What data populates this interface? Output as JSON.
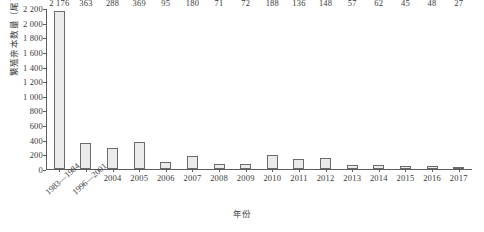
{
  "chart_data": {
    "type": "bar",
    "title": "",
    "xlabel": "年份",
    "ylabel": "繁殖亲本数量（尾）",
    "categories": [
      "1983—1984",
      "1996—2001",
      "2004",
      "2005",
      "2006",
      "2007",
      "2008",
      "2009",
      "2010",
      "2011",
      "2012",
      "2013",
      "2014",
      "2015",
      "2016",
      "2017"
    ],
    "values": [
      2176,
      363,
      288,
      369,
      95,
      180,
      71,
      72,
      188,
      136,
      148,
      57,
      62,
      45,
      48,
      27
    ],
    "value_labels": [
      "2 176",
      "363",
      "288",
      "369",
      "95",
      "180",
      "71",
      "72",
      "188",
      "136",
      "148",
      "57",
      "62",
      "45",
      "48",
      "27"
    ],
    "rotated_categories": [
      "1983—1984",
      "1996—2001"
    ],
    "ylim": [
      0,
      2200
    ],
    "ytick_step": 200,
    "ytick_labels": [
      "0",
      "200",
      "400",
      "600",
      "800",
      "1 000",
      "1 200",
      "1 400",
      "1 600",
      "1 800",
      "2 000",
      "2 200"
    ],
    "grid": false,
    "legend": "none",
    "bar_fill": "#ebebeb",
    "bar_border": "#6b6b6b",
    "axis_color": "#5d5d5d",
    "text_color": "#3a3a3a"
  }
}
